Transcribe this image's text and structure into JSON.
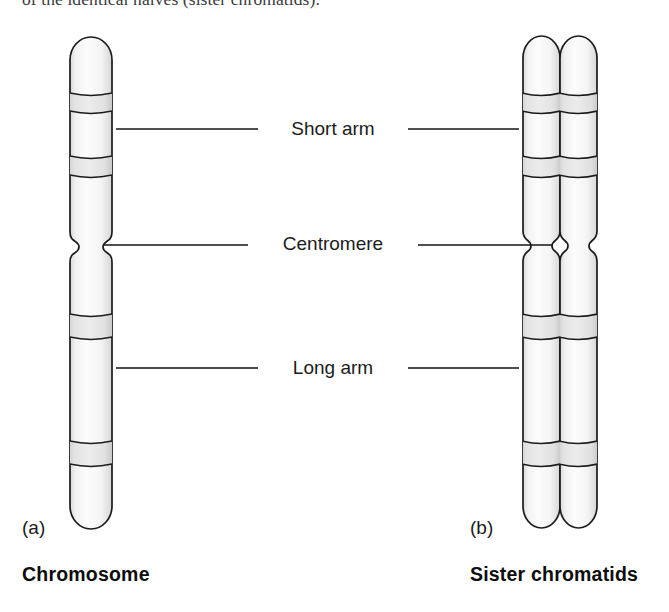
{
  "page": {
    "background_color": "#ffffff",
    "width": 669,
    "height": 612
  },
  "body_text": {
    "cut_off_line": "of the identical halves (sister chromatids)."
  },
  "figure": {
    "type": "biology-diagram",
    "outline_color": "#1a1a1a",
    "fill_color": "#f4f4f4",
    "band_fill_color": "#dddddd",
    "leader_line_color": "#151515",
    "callouts": [
      {
        "id": "short-arm",
        "label": "Short arm"
      },
      {
        "id": "centromere",
        "label": "Centromere"
      },
      {
        "id": "long-arm",
        "label": "Long arm"
      }
    ],
    "panels": [
      {
        "letter": "(a)",
        "caption": "Chromosome",
        "chromatid_count": 1
      },
      {
        "letter": "(b)",
        "caption": "Sister chromatids",
        "chromatid_count": 2
      }
    ]
  }
}
